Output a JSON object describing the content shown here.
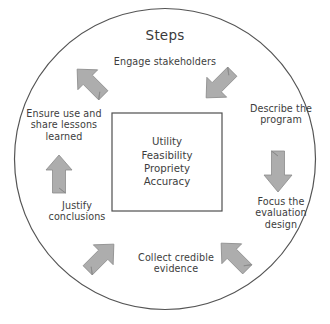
{
  "diagram": {
    "title": "Steps",
    "center_box": {
      "lines": [
        "Utility",
        "Feasibility",
        "Propriety",
        "Accuracy"
      ],
      "text": "Utility\nFeasibility\nPropriety\nAccuracy"
    },
    "steps": [
      {
        "id": "engage",
        "text": "Engage stakeholders",
        "position": "top"
      },
      {
        "id": "describe",
        "text": "Describe the\nprogram",
        "position": "right-upper"
      },
      {
        "id": "focus",
        "text": "Focus the\nevaluation\ndesign",
        "position": "right-lower"
      },
      {
        "id": "collect",
        "text": "Collect credible\nevidence",
        "position": "bottom"
      },
      {
        "id": "justify",
        "text": "Justify\nconclusions",
        "position": "left-lower"
      },
      {
        "id": "ensure",
        "text": "Ensure use and\nshare lessons\nlearned",
        "position": "left-upper"
      }
    ],
    "arrows": [
      {
        "id": "arrow-engage-to-describe",
        "direction": "down-right",
        "between": "Engage stakeholders → Describe the program"
      },
      {
        "id": "arrow-describe-to-focus",
        "direction": "down",
        "between": "Describe the program → Focus the evaluation design"
      },
      {
        "id": "arrow-focus-to-collect",
        "direction": "down-left",
        "between": "Focus the evaluation design → Collect credible evidence"
      },
      {
        "id": "arrow-collect-to-justify",
        "direction": "up-left",
        "between": "Collect credible evidence → Justify conclusions"
      },
      {
        "id": "arrow-justify-to-ensure",
        "direction": "up",
        "between": "Justify conclusions → Ensure use and share lessons learned"
      },
      {
        "id": "arrow-ensure-to-engage",
        "direction": "up-right",
        "between": "Ensure use and share lessons learned → Engage stakeholders"
      }
    ],
    "colors": {
      "arrow_fill": "#adadad",
      "arrow_stroke": "#8a8a8a",
      "circle_stroke": "#545454",
      "box_stroke": "#4f4f4f",
      "text": "#3d3d3d",
      "background": "#ffffff"
    }
  }
}
